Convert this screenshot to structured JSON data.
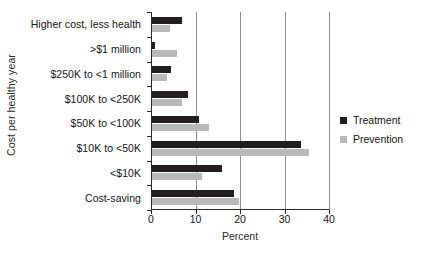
{
  "chart_data": {
    "type": "bar",
    "orientation": "horizontal",
    "title": "",
    "xlabel": "Percent",
    "ylabel": "Cost per healthy year",
    "categories": [
      "Higher cost, less health",
      ">$1 million",
      "$250K to <1 million",
      "$100K to <250K",
      "$50K to <100K",
      "$10K to <50K",
      "<$10K",
      "Cost-saving"
    ],
    "series": [
      {
        "name": "Treatment",
        "color": "#231f20",
        "values": [
          7.0,
          1.0,
          4.5,
          8.3,
          10.7,
          33.6,
          16.0,
          18.6
        ]
      },
      {
        "name": "Prevention",
        "color": "#b9b9b9",
        "values": [
          4.3,
          5.9,
          3.7,
          7.0,
          13.0,
          35.6,
          11.5,
          19.7
        ]
      }
    ],
    "xlim": [
      0,
      40
    ],
    "xticks": [
      0,
      10,
      20,
      30,
      40
    ],
    "xtick_labels": [
      "0",
      "10",
      "20",
      "30",
      "40"
    ],
    "grid": "vertical",
    "legend_position": "right"
  },
  "legend": {
    "items": [
      {
        "label": "Treatment"
      },
      {
        "label": "Prevention"
      }
    ]
  }
}
